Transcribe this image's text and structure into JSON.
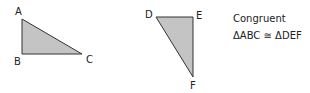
{
  "diagram": {
    "triangles": [
      {
        "name": "ABC",
        "fill": "#c4c4c4",
        "stroke": "#333333",
        "vertices": [
          {
            "label": "A"
          },
          {
            "label": "B"
          },
          {
            "label": "C"
          }
        ]
      },
      {
        "name": "DEF",
        "fill": "#c4c4c4",
        "stroke": "#333333",
        "vertices": [
          {
            "label": "D"
          },
          {
            "label": "E"
          },
          {
            "label": "F"
          }
        ]
      }
    ],
    "caption": {
      "title": "Congruent",
      "statement": "ΔABC ≅ ΔDEF"
    }
  }
}
